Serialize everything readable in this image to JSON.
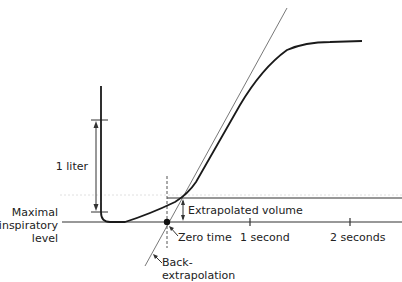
{
  "diagram": {
    "labels": {
      "scale": "1 liter",
      "baseline_line1": "Maximal",
      "baseline_line2": "inspiratory",
      "baseline_line3": "level",
      "extrapolated_volume": "Extrapolated volume",
      "zero_time": "Zero time",
      "one_second": "1 second",
      "two_seconds": "2 seconds",
      "back_line1": "Back-",
      "back_line2": "extrapolation"
    },
    "colors": {
      "curve": "#1a1a1a",
      "tangent": "#555555",
      "text": "#222222",
      "background": "#ffffff"
    }
  }
}
